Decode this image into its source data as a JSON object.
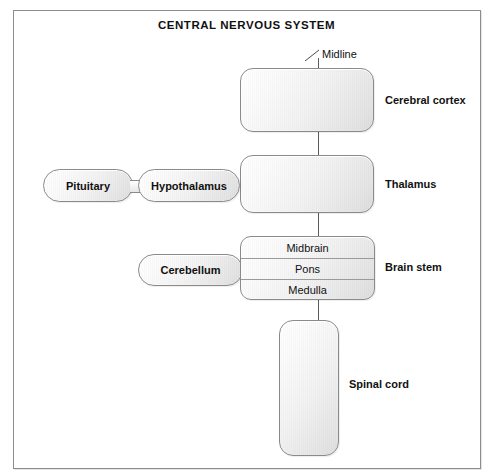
{
  "figure": {
    "title": "CENTRAL NERVOUS SYSTEM",
    "midline_label": "Midline"
  },
  "structures": {
    "cerebral_cortex": {
      "label": "Cerebral cortex"
    },
    "thalamus": {
      "label": "Thalamus"
    },
    "brain_stem": {
      "label": "Brain stem",
      "segments": [
        {
          "label": "Midbrain"
        },
        {
          "label": "Pons"
        },
        {
          "label": "Medulla"
        }
      ]
    },
    "spinal_cord": {
      "label": "Spinal cord"
    },
    "pituitary": {
      "label": "Pituitary"
    },
    "hypothalamus": {
      "label": "Hypothalamus"
    },
    "cerebellum": {
      "label": "Cerebellum"
    }
  },
  "colors": {
    "frame_border": "#8d8d8d",
    "organ_border": "#8a8a8a",
    "organ_fill_light": "#ffffff",
    "organ_fill_dark": "#dcdcdc",
    "midline": "#5b5b5b",
    "text": "#111111",
    "background": "#ffffff"
  }
}
